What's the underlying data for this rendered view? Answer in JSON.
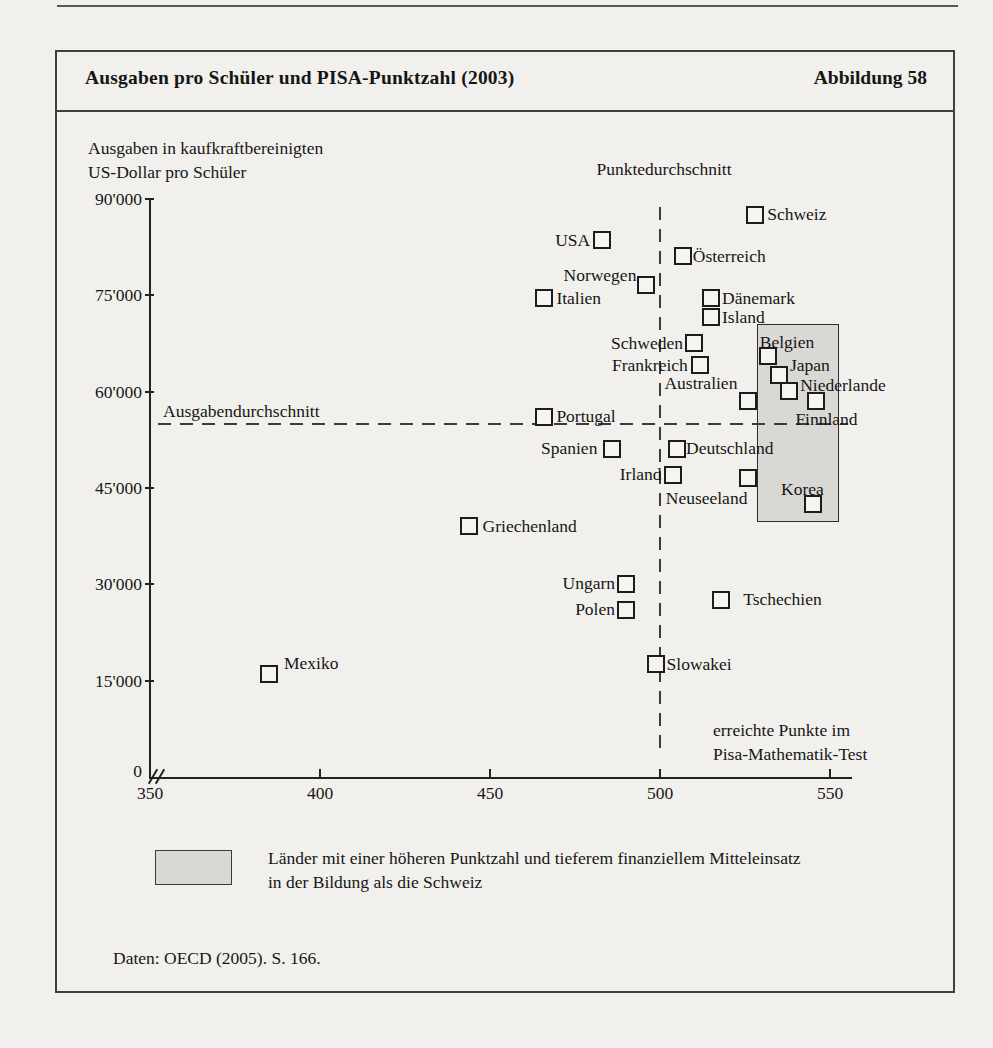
{
  "figure": {
    "title": "Ausgaben pro Schüler und PISA-Punktzahl (2003)",
    "figure_label": "Abbildung 58",
    "source": "Daten: OECD (2005). S. 166."
  },
  "chart_data": {
    "type": "scatter",
    "title": "Ausgaben pro Schüler und PISA-Punktzahl (2003)",
    "y_axis": {
      "label_line1": "Ausgaben in kaufkraftbereinigten",
      "label_line2": "US-Dollar pro Schüler",
      "range": [
        0,
        90000
      ],
      "ticks": [
        {
          "value": 90000,
          "label": "90'000"
        },
        {
          "value": 75000,
          "label": "75'000"
        },
        {
          "value": 60000,
          "label": "60'000"
        },
        {
          "value": 45000,
          "label": "45'000"
        },
        {
          "value": 30000,
          "label": "30'000"
        },
        {
          "value": 15000,
          "label": "15'000"
        },
        {
          "value": 0,
          "label": "0"
        }
      ]
    },
    "x_axis": {
      "label_line1": "erreichte Punkte im",
      "label_line2": "Pisa-Mathematik-Test",
      "range": [
        350,
        550
      ],
      "axis_break": true,
      "ticks": [
        {
          "value": 350,
          "label": "350"
        },
        {
          "value": 400,
          "label": "400"
        },
        {
          "value": 450,
          "label": "450"
        },
        {
          "value": 500,
          "label": "500"
        },
        {
          "value": 550,
          "label": "550"
        }
      ]
    },
    "mean_lines": {
      "vertical": {
        "value": 500,
        "label": "Punktedurchschnitt"
      },
      "horizontal": {
        "value": 55000,
        "label": "Ausgabendurchschnitt"
      }
    },
    "highlight_region": {
      "score_min": 528.5,
      "score_max": 552,
      "spending_min": 40000,
      "spending_max": 70500,
      "fill": "#d9d8d4"
    },
    "points": [
      {
        "name": "Schweiz",
        "score": 528,
        "spending": 87500,
        "label_side": "r",
        "dx": 2,
        "dy": 0
      },
      {
        "name": "USA",
        "score": 483,
        "spending": 83500,
        "label_side": "l",
        "dx": -2,
        "dy": 0
      },
      {
        "name": "Österreich",
        "score": 507,
        "spending": 81000,
        "label_side": "r",
        "dx": -1,
        "dy": 0
      },
      {
        "name": "Norwegen",
        "score": 496,
        "spending": 76500,
        "label_side": "l",
        "dx": 0,
        "dy": -10
      },
      {
        "name": "Italien",
        "score": 466,
        "spending": 74500,
        "label_side": "r",
        "dx": 2,
        "dy": 0
      },
      {
        "name": "Dänemark",
        "score": 515,
        "spending": 74500,
        "label_side": "r",
        "dx": 1,
        "dy": 0
      },
      {
        "name": "Island",
        "score": 515,
        "spending": 71500,
        "label_side": "r",
        "dx": 1,
        "dy": 0
      },
      {
        "name": "Schweden",
        "score": 510,
        "spending": 67500,
        "label_side": "l",
        "dx": -1,
        "dy": 0
      },
      {
        "name": "Belgien",
        "score": 532,
        "spending": 65500,
        "label_side": "r",
        "dx": -19,
        "dy": -13
      },
      {
        "name": "Frankreich",
        "score": 512,
        "spending": 64000,
        "label_side": "l",
        "dx": -3,
        "dy": 0
      },
      {
        "name": "Japan",
        "score": 535,
        "spending": 62500,
        "label_side": "r",
        "dx": 1,
        "dy": -10
      },
      {
        "name": "Niederlande",
        "score": 538,
        "spending": 60000,
        "label_side": "r",
        "dx": 1,
        "dy": -6
      },
      {
        "name": "Australien",
        "score": 526,
        "spending": 58500,
        "label_side": "l",
        "dx": -1,
        "dy": -17
      },
      {
        "name": "Finnland",
        "score": 546,
        "spending": 58500,
        "label_side": "r",
        "dx": -31,
        "dy": 19
      },
      {
        "name": "Portugal",
        "score": 466,
        "spending": 56000,
        "label_side": "r",
        "dx": 2,
        "dy": 0
      },
      {
        "name": "Spanien",
        "score": 486,
        "spending": 51000,
        "label_side": "l",
        "dx": -5,
        "dy": 0
      },
      {
        "name": "Deutschland",
        "score": 505,
        "spending": 51000,
        "label_side": "r",
        "dx": -1,
        "dy": 0
      },
      {
        "name": "Irland",
        "score": 504,
        "spending": 47000,
        "label_side": "l",
        "dx": -2,
        "dy": 0
      },
      {
        "name": "Neuseeland",
        "score": 526,
        "spending": 46500,
        "label_side": "l",
        "dx": 9,
        "dy": 21
      },
      {
        "name": "Korea",
        "score": 545,
        "spending": 42500,
        "label_side": "r",
        "dx": -42,
        "dy": -14
      },
      {
        "name": "Griechenland",
        "score": 444,
        "spending": 39000,
        "label_side": "r",
        "dx": 3,
        "dy": 0
      },
      {
        "name": "Ungarn",
        "score": 490,
        "spending": 30000,
        "label_side": "l",
        "dx": -1,
        "dy": 0
      },
      {
        "name": "Polen",
        "score": 490,
        "spending": 26000,
        "label_side": "l",
        "dx": -1,
        "dy": 0
      },
      {
        "name": "Tschechien",
        "score": 518,
        "spending": 27500,
        "label_side": "r",
        "dx": 12,
        "dy": 0
      },
      {
        "name": "Slowakei",
        "score": 499,
        "spending": 17500,
        "label_side": "r",
        "dx": 0,
        "dy": 0
      },
      {
        "name": "Mexiko",
        "score": 385,
        "spending": 16000,
        "label_side": "r",
        "dx": 5,
        "dy": -10
      }
    ],
    "legend": {
      "swatch_color": "#d9d8d4",
      "text_line1": "Länder mit einer höheren Punktzahl und tieferem finanziellem Mitteleinsatz",
      "text_line2": "in der Bildung als die Schweiz"
    }
  }
}
